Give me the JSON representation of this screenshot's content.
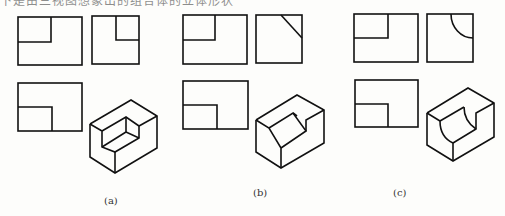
{
  "header": {
    "truncated_text": "下是由三视图想象出的组合体的立体形状"
  },
  "figures": [
    {
      "label": "(a)",
      "cut_type": "rectangular notch"
    },
    {
      "label": "(b)",
      "cut_type": "inclined plane notch"
    },
    {
      "label": "(c)",
      "cut_type": "cylindrical notch"
    }
  ],
  "colors": {
    "line": "#111111",
    "background": "#fdfdfb"
  }
}
